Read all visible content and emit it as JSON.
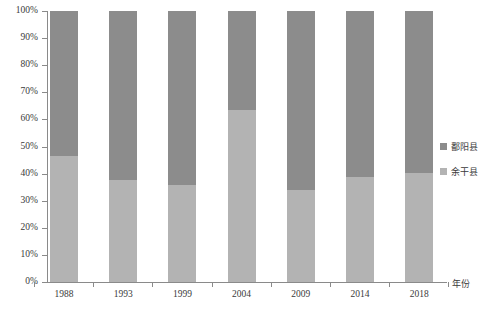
{
  "chart_data": {
    "type": "bar",
    "stacked": true,
    "normalized": true,
    "title": "",
    "xlabel": "年份",
    "ylabel": "",
    "categories": [
      "1988",
      "1993",
      "1999",
      "2004",
      "2009",
      "2014",
      "2018"
    ],
    "ylim": [
      0,
      100
    ],
    "ytick_labels": [
      "0%",
      "10%",
      "20%",
      "30%",
      "40%",
      "50%",
      "60%",
      "70%",
      "80%",
      "90%",
      "100%"
    ],
    "ytick_values": [
      0,
      10,
      20,
      30,
      40,
      50,
      60,
      70,
      80,
      90,
      100
    ],
    "grid": false,
    "legend_position": "right",
    "series": [
      {
        "name": "鄱阳县",
        "color": "#8c8c8c",
        "values": [
          53.5,
          62.4,
          64.2,
          36.5,
          66.0,
          61.3,
          59.8
        ]
      },
      {
        "name": "余干县",
        "color": "#b3b3b3",
        "values": [
          46.5,
          37.6,
          35.8,
          63.5,
          34.0,
          38.7,
          40.2
        ]
      }
    ]
  },
  "axis": {
    "x_title": "年份"
  },
  "colors": {
    "series_dark": "#8c8c8c",
    "series_light": "#b3b3b3",
    "axis_line": "#8a8a8a",
    "text": "#3a3a3a",
    "background": "#ffffff"
  }
}
